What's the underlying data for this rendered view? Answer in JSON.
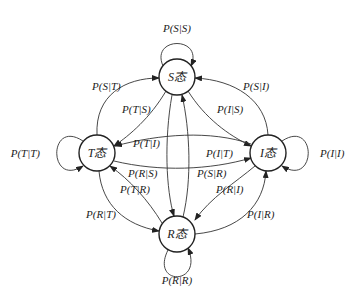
{
  "diagram": {
    "type": "state-transition",
    "nodes": [
      {
        "id": "S",
        "label": "S态",
        "cx": 177,
        "cy": 77
      },
      {
        "id": "T",
        "label": "T态",
        "cx": 97,
        "cy": 153
      },
      {
        "id": "I",
        "label": "I态",
        "cx": 268,
        "cy": 153
      },
      {
        "id": "R",
        "label": "R态",
        "cx": 177,
        "cy": 234
      }
    ],
    "edges": {
      "SS": "P(S|S)",
      "TT": "P(T|T)",
      "II": "P(I|I)",
      "RR": "P(R|R)",
      "TtoS": "P(S|T)",
      "StoT": "P(T|S)",
      "ItoS": "P(S|I)",
      "StoI": "P(I|S)",
      "ItoT": "P(T|I)",
      "TtoI": "P(I|T)",
      "StoR": "P(R|S)",
      "RtoS": "P(S|R)",
      "RtoT": "P(T|R)",
      "TtoR": "P(R|T)",
      "ItoR": "P(R|I)",
      "RtoI": "P(I|R)"
    }
  }
}
